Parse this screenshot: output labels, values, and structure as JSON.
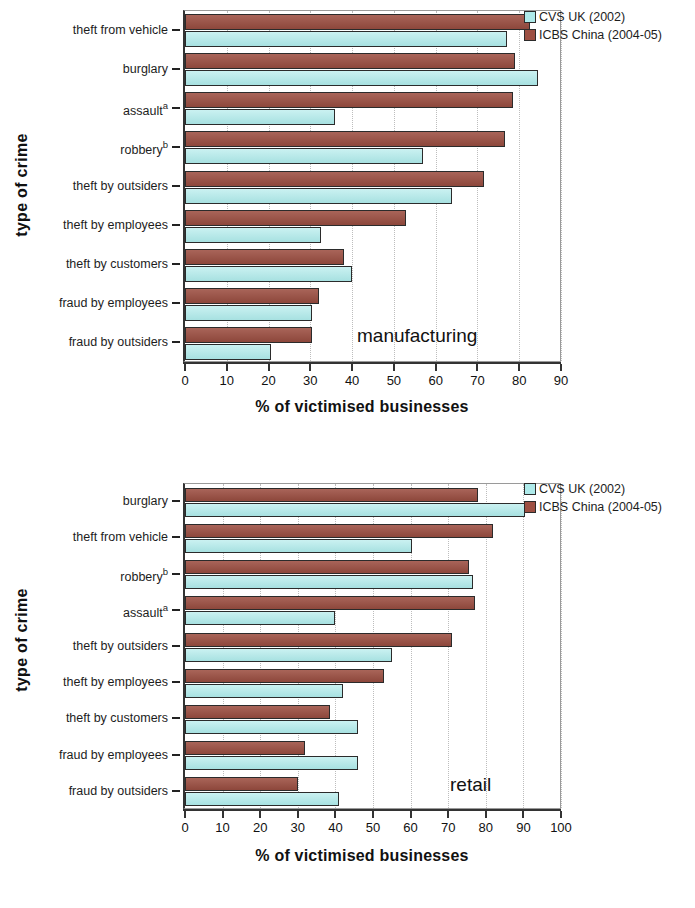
{
  "figure": {
    "colors": {
      "cvs_uk": "#aeeaea",
      "icbs_china": "#9d4f42",
      "axis": "#333333",
      "gridline": "#bdbdbd"
    },
    "legend": [
      {
        "label": "CVS UK (2002)",
        "key": "cvs"
      },
      {
        "label": "ICBS China (2004-05)",
        "key": "icbs"
      }
    ]
  },
  "chart_data": [
    {
      "id": "manufacturing",
      "type": "bar",
      "orientation": "horizontal",
      "title": "",
      "panel_note": "manufacturing",
      "xlabel": "% of victimised businesses",
      "ylabel": "type of crime",
      "xlim": [
        0,
        90
      ],
      "xticks": [
        0,
        10,
        20,
        30,
        40,
        50,
        60,
        70,
        80,
        90
      ],
      "xticklabels": [
        "0",
        "10",
        "20",
        "30",
        "40",
        "50",
        "60",
        "70",
        "80",
        "90"
      ],
      "grid": "vertical-dotted",
      "legend_position": "top-right-outside",
      "categories": [
        "theft from vehicle",
        "burglary",
        "assault",
        "robbery",
        "theft by outsiders",
        "theft by employees",
        "theft by customers",
        "fraud by employees",
        "fraud by outsiders"
      ],
      "category_superscripts": [
        "",
        "",
        "a",
        "b",
        "",
        "",
        "",
        "",
        ""
      ],
      "series": [
        {
          "name": "CVS UK (2002)",
          "key": "cvs",
          "values": [
            77,
            84.5,
            36,
            57,
            64,
            32.5,
            40,
            30.5,
            20.5
          ]
        },
        {
          "name": "ICBS China (2004-05)",
          "key": "icbs",
          "values": [
            82.5,
            79,
            78.5,
            76.5,
            71.5,
            53,
            38,
            32,
            30.5
          ]
        }
      ]
    },
    {
      "id": "retail",
      "type": "bar",
      "orientation": "horizontal",
      "title": "",
      "panel_note": "retail",
      "xlabel": "% of victimised businesses",
      "ylabel": "type of crime",
      "xlim": [
        0,
        100
      ],
      "xticks": [
        0,
        10,
        20,
        30,
        40,
        50,
        60,
        70,
        80,
        90,
        100
      ],
      "xticklabels": [
        "0",
        "10",
        "20",
        "30",
        "40",
        "50",
        "60",
        "70",
        "80",
        "90",
        "100"
      ],
      "grid": "vertical-dotted",
      "legend_position": "top-right-outside",
      "categories": [
        "burglary",
        "theft from vehicle",
        "robbery",
        "assault",
        "theft by outsiders",
        "theft by employees",
        "theft by customers",
        "fraud by employees",
        "fraud by outsiders"
      ],
      "category_superscripts": [
        "",
        "",
        "b",
        "a",
        "",
        "",
        "",
        "",
        ""
      ],
      "series": [
        {
          "name": "CVS UK (2002)",
          "key": "cvs",
          "values": [
            90.5,
            60.5,
            76.5,
            40,
            55,
            42,
            46,
            46,
            41
          ]
        },
        {
          "name": "ICBS China (2004-05)",
          "key": "icbs",
          "values": [
            78,
            82,
            75.5,
            77,
            71,
            53,
            38.5,
            32,
            30
          ]
        }
      ]
    }
  ]
}
